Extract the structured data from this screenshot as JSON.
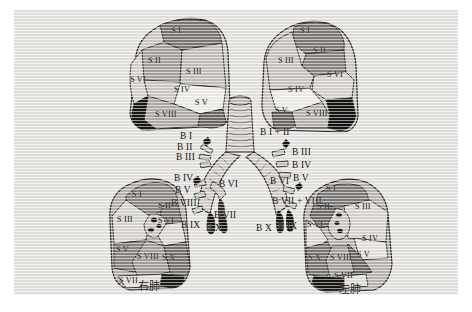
{
  "figure": {
    "background_color": "#e8e6e3",
    "ink_color": "#17150f",
    "page_color": "#ffffff"
  },
  "captions": [
    {
      "name": "right-lung-caption",
      "text": "右肺",
      "x": 138,
      "y": 281
    },
    {
      "name": "left-lung-caption",
      "text": "左肺",
      "x": 339,
      "y": 284
    }
  ],
  "lungs": [
    {
      "id": "upper-left-lung",
      "position": "top-left",
      "view": "lateral",
      "segments": [
        {
          "label": "S I",
          "x": 171,
          "y": 27
        },
        {
          "label": "S II",
          "x": 148,
          "y": 57
        },
        {
          "label": "S III",
          "x": 186,
          "y": 68
        },
        {
          "label": "S VI",
          "x": 130,
          "y": 76
        },
        {
          "label": "S IV",
          "x": 174,
          "y": 86
        },
        {
          "label": "S V",
          "x": 195,
          "y": 99
        },
        {
          "label": "S VIII",
          "x": 155,
          "y": 111
        }
      ]
    },
    {
      "id": "upper-right-lung",
      "position": "top-right",
      "view": "lateral",
      "segments": [
        {
          "label": "S I",
          "x": 300,
          "y": 27
        },
        {
          "label": "S II",
          "x": 313,
          "y": 47
        },
        {
          "label": "S III",
          "x": 278,
          "y": 57
        },
        {
          "label": "S VI",
          "x": 327,
          "y": 71
        },
        {
          "label": "S IV",
          "x": 288,
          "y": 86
        },
        {
          "label": "S V",
          "x": 275,
          "y": 107
        },
        {
          "label": "S VIII",
          "x": 306,
          "y": 110
        }
      ]
    },
    {
      "id": "lower-left-lung",
      "position": "bottom-left",
      "view": "medial",
      "segments": [
        {
          "label": "S I",
          "x": 132,
          "y": 191
        },
        {
          "label": "S II",
          "x": 158,
          "y": 202
        },
        {
          "label": "S III",
          "x": 117,
          "y": 216
        },
        {
          "label": "S VI",
          "x": 158,
          "y": 217
        },
        {
          "label": "S V",
          "x": 116,
          "y": 246
        },
        {
          "label": "S VIII",
          "x": 137,
          "y": 253
        },
        {
          "label": "S X",
          "x": 162,
          "y": 254
        },
        {
          "label": "S VII",
          "x": 119,
          "y": 277
        }
      ]
    },
    {
      "id": "lower-right-lung",
      "position": "bottom-right",
      "view": "medial",
      "segments": [
        {
          "label": "S I",
          "x": 326,
          "y": 185
        },
        {
          "label": "S II",
          "x": 317,
          "y": 203
        },
        {
          "label": "S III",
          "x": 355,
          "y": 203
        },
        {
          "label": "S VI",
          "x": 307,
          "y": 221
        },
        {
          "label": "S IV",
          "x": 362,
          "y": 235
        },
        {
          "label": "S V",
          "x": 357,
          "y": 251
        },
        {
          "label": "S X",
          "x": 308,
          "y": 254
        },
        {
          "label": "S VIII",
          "x": 330,
          "y": 254
        },
        {
          "label": "S VII",
          "x": 334,
          "y": 272
        }
      ]
    }
  ],
  "bronchi": {
    "right_lung_branches": [
      {
        "label": "B I",
        "x": 180,
        "y": 132
      },
      {
        "label": "B II",
        "x": 177,
        "y": 143
      },
      {
        "label": "B III",
        "x": 176,
        "y": 153
      },
      {
        "label": "B IV",
        "x": 174,
        "y": 174
      },
      {
        "label": "B V",
        "x": 175,
        "y": 186
      },
      {
        "label": "B VIII",
        "x": 171,
        "y": 199
      },
      {
        "label": "B IX",
        "x": 181,
        "y": 221
      },
      {
        "label": "B X",
        "x": 206,
        "y": 224
      },
      {
        "label": "B VI",
        "x": 219,
        "y": 180
      },
      {
        "label": "B VII",
        "x": 214,
        "y": 211
      }
    ],
    "left_lung_branches": [
      {
        "label": "B I + II",
        "x": 260,
        "y": 128
      },
      {
        "label": "B III",
        "x": 292,
        "y": 148
      },
      {
        "label": "B IV",
        "x": 292,
        "y": 161
      },
      {
        "label": "B V",
        "x": 293,
        "y": 174
      },
      {
        "label": "B VI",
        "x": 270,
        "y": 177
      },
      {
        "label": "B VII + VIII",
        "x": 272,
        "y": 197
      },
      {
        "label": "B IX",
        "x": 278,
        "y": 222
      },
      {
        "label": "B X",
        "x": 256,
        "y": 224
      }
    ]
  },
  "palette": {
    "segment_light": "#d8d5d0",
    "segment_mid": "#b2aea8",
    "segment_dark": "#8e8a85",
    "segment_darker": "#6d6a66",
    "segment_black": "#191816",
    "segment_white": "#f2f0ec",
    "outline": "#2a2824",
    "trachea_fill": "#cfccc6"
  }
}
